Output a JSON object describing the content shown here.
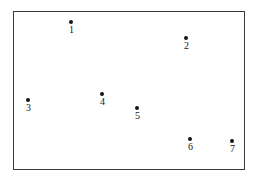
{
  "figure": {
    "background_color": "#ffffff",
    "frame": {
      "border_color": "#3a3a3a",
      "x": 13,
      "y": 11,
      "width": 232,
      "height": 159
    },
    "marker_color": "#151515",
    "label_color": "#161616"
  },
  "chart_data": {
    "type": "scatter",
    "title": "",
    "xlabel": "",
    "ylabel": "",
    "grid": false,
    "legend": null,
    "axis_ticks": [],
    "xlim": [
      13,
      245
    ],
    "ylim": [
      11,
      170
    ],
    "note": "Unlabeled scatter of seven numbered points inside a plain rectangular frame; coordinates are pixel positions within the frame.",
    "points": [
      {
        "label": "1",
        "x": 70,
        "y": 21
      },
      {
        "label": "2",
        "x": 185,
        "y": 37
      },
      {
        "label": "3",
        "x": 27,
        "y": 99
      },
      {
        "label": "4",
        "x": 101,
        "y": 93
      },
      {
        "label": "5",
        "x": 136,
        "y": 107
      },
      {
        "label": "6",
        "x": 189,
        "y": 138
      },
      {
        "label": "7",
        "x": 231,
        "y": 140
      }
    ]
  }
}
